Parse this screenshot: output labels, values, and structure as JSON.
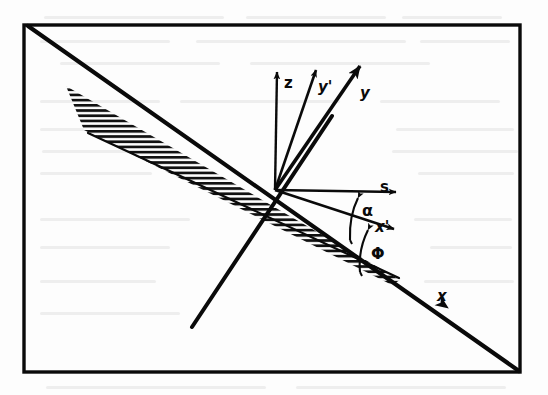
{
  "figure": {
    "type": "vector-diagram",
    "colors": {
      "ink": "#0a0a0a",
      "paper": "#fdfdfd",
      "smudge": "#d8d8d8"
    },
    "frame": {
      "name": "page-border",
      "x": 24,
      "y": 25,
      "width": 498,
      "height": 348,
      "stroke_width": 3
    },
    "origin": {
      "x": 275,
      "y": 190
    },
    "labels": {
      "z": "z",
      "y_prime": "y'",
      "y": "y",
      "s": "s",
      "alpha": "α",
      "x_prime": "x'",
      "phi": "Φ",
      "x": "x"
    },
    "axes": [
      {
        "name": "z-axis",
        "label": "z",
        "from": [
          275,
          190
        ],
        "to": [
          277,
          66
        ],
        "thick": false
      },
      {
        "name": "y-prime-axis",
        "label": "y'",
        "from": [
          275,
          190
        ],
        "to": [
          316,
          62
        ],
        "thick": false
      },
      {
        "name": "y-axis",
        "label": "y",
        "from": [
          275,
          190
        ],
        "to": [
          362,
          58
        ],
        "thick": true
      },
      {
        "name": "s-axis",
        "label": "s",
        "from": [
          275,
          190
        ],
        "to": [
          402,
          192
        ],
        "thick": false
      },
      {
        "name": "x-prime-axis",
        "label": "x'",
        "from": [
          275,
          190
        ],
        "to": [
          400,
          231
        ],
        "thick": false
      },
      {
        "name": "x-axis",
        "label": "x",
        "from": [
          28,
          26
        ],
        "to": [
          519,
          371
        ],
        "thick": true
      }
    ],
    "angles": [
      {
        "name": "alpha-arc",
        "label": "α",
        "between": [
          "s-axis",
          "x-prime-axis"
        ]
      },
      {
        "name": "phi-arc",
        "label": "Φ",
        "between": [
          "x-prime-axis",
          "x-axis"
        ]
      }
    ],
    "hatched_region": {
      "name": "hatched-plane",
      "hatch_lines": 26,
      "orientation": "horizontal",
      "tip": [
        66,
        86
      ],
      "wide_end": [
        398,
        278
      ]
    },
    "extra_lines": [
      {
        "name": "thin-plane-edge",
        "from": [
          88,
          133
        ],
        "to": [
          398,
          277
        ]
      },
      {
        "name": "steep-thick-line",
        "from": [
          192,
          327
        ],
        "to": [
          330,
          120
        ]
      }
    ]
  }
}
